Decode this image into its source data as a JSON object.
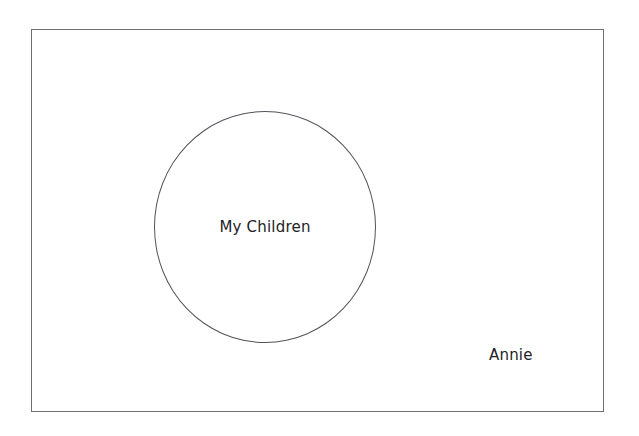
{
  "diagram": {
    "type": "venn-set-diagram",
    "universe": {
      "name": "universal-set",
      "shape": "rectangle",
      "label": "",
      "border_color": "#6e6e72"
    },
    "sets": [
      {
        "id": "my-children",
        "label": "My Children",
        "shape": "circle",
        "border_color": "#53535a",
        "fill": "none"
      }
    ],
    "elements": [
      {
        "id": "annie",
        "label": "Annie",
        "inside_set": false,
        "inside_universe": true,
        "text_color": "#232326"
      }
    ]
  }
}
